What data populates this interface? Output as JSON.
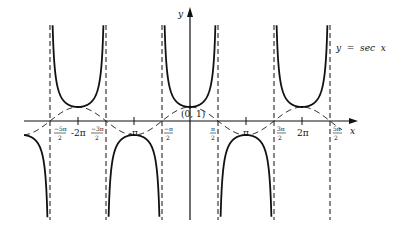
{
  "chart_data": {
    "type": "line",
    "title": "",
    "function": "y = sec x",
    "legend_label": "y  =  sec  x",
    "xlabel": "x",
    "ylabel": "y",
    "xlim": [
      -2.75,
      3.1
    ],
    "ylim": [
      -7,
      7
    ],
    "grid": false,
    "x_tick_labels": [
      {
        "num": "−5π",
        "den": "2",
        "value": -7.853982
      },
      {
        "text": "-2π",
        "value": -6.283185
      },
      {
        "num": "−3π",
        "den": "2",
        "value": -4.712389
      },
      {
        "text": "-π",
        "value": -3.141593
      },
      {
        "num": "−π",
        "den": "2",
        "value": -1.570796
      },
      {
        "num": "π",
        "den": "2",
        "value": 1.570796
      },
      {
        "text": "π",
        "value": 3.141593
      },
      {
        "num": "3π",
        "den": "2",
        "value": 4.712389
      },
      {
        "text": "2π",
        "value": 6.283185
      },
      {
        "num": "5π",
        "den": "2",
        "value": 7.853982
      }
    ],
    "annotations": [
      {
        "text": "(0, 1)",
        "x": 0,
        "y": 1
      }
    ],
    "asymptotes": [
      -7.853982,
      -4.712389,
      -1.570796,
      1.570796,
      4.712389,
      7.853982
    ],
    "series": [
      {
        "name": "sec x",
        "style": "solid",
        "description": "U-shaped branches between asymptotes, min 1 at even multiples of π, max -1 at odd multiples of π"
      },
      {
        "name": "cos x",
        "style": "dashed",
        "description": "reference cosine curve touching sec x at (kπ, ±1)"
      }
    ],
    "key_points": [
      {
        "x": -6.283185,
        "y": 1
      },
      {
        "x": -3.141593,
        "y": -1
      },
      {
        "x": 0,
        "y": 1
      },
      {
        "x": 3.141593,
        "y": -1
      },
      {
        "x": 6.283185,
        "y": 1
      }
    ]
  },
  "labels": {
    "y_axis": "y",
    "x_axis": "x",
    "legend": "y  =  sec  x",
    "point": "(0, 1)",
    "neg_2pi": "-2π",
    "neg_pi": "-π",
    "pi": "π",
    "two_pi": "2π",
    "neg_5pi_num": "−5π",
    "neg_3pi_num": "−3π",
    "neg_pi_num": "−π",
    "pi_num": "π",
    "three_pi_num": "3π",
    "five_pi_num": "5π",
    "den": "2"
  }
}
